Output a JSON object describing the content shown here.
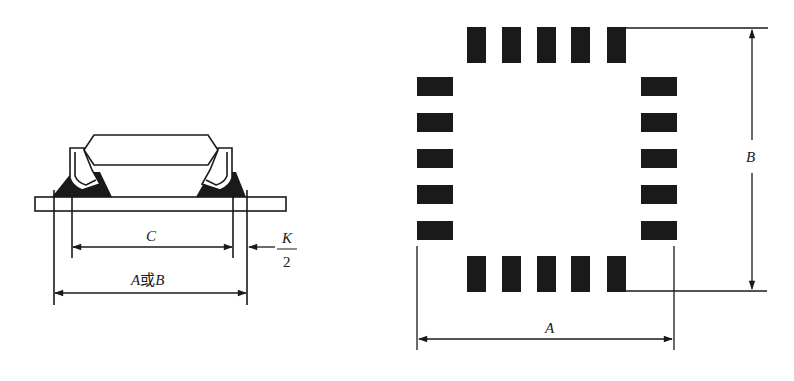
{
  "figure": {
    "left_view": {
      "description": "side view of chip package soldered on PCB",
      "labels": {
        "c": "C",
        "a_or_b_a": "A",
        "a_or_b_or": "或",
        "a_or_b_b": "B",
        "k_num": "K",
        "k_den": "2"
      }
    },
    "right_view": {
      "description": "top view of land pattern with 5 pads per side",
      "pads_per_side": 5,
      "labels": {
        "a": "A",
        "b": "B"
      }
    },
    "colors": {
      "ink": "#1a1a1a",
      "background": "#ffffff"
    }
  }
}
